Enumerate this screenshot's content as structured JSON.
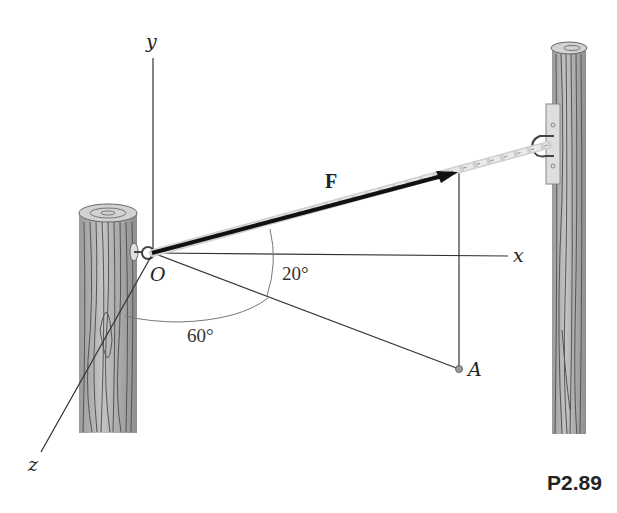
{
  "figure": {
    "problem_id": "P2.89",
    "axes": {
      "x_label": "x",
      "y_label": "y",
      "z_label": "z",
      "origin_label": "O"
    },
    "force_label": "F",
    "point_label": "A",
    "angles": {
      "angle_1": "20°",
      "angle_2": "60°"
    },
    "colors": {
      "line": "#333333",
      "rope_dark": "#111111",
      "rope_light": "#e6e6e6",
      "wood": "#b5b5b5",
      "grain": "#555555",
      "bracket": "#dcdcdc"
    }
  }
}
